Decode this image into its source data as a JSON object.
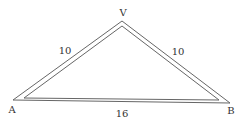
{
  "diagram": {
    "type": "isosceles-triangle",
    "vertices": {
      "V": {
        "label": "V",
        "x": 122,
        "y": 21
      },
      "A": {
        "label": "A",
        "x": 13,
        "y": 100
      },
      "B": {
        "label": "B",
        "x": 230,
        "y": 103
      }
    },
    "sides": {
      "VA": {
        "label": "10"
      },
      "VB": {
        "label": "10"
      },
      "AB": {
        "label": "16"
      }
    },
    "stroke_color": "#555555"
  }
}
